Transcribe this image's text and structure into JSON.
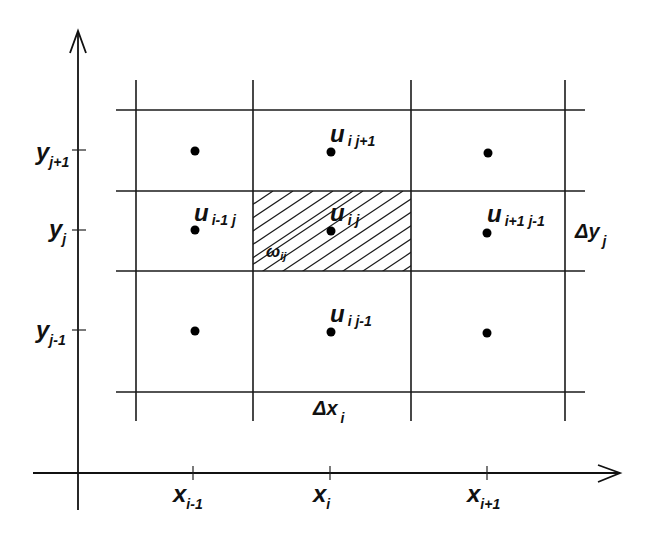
{
  "figure": {
    "colors": {
      "line": "#1a1a1a",
      "background": "#ffffff",
      "dot": "#000000"
    }
  },
  "axes": {
    "x_ticks": [
      {
        "base": "x",
        "sub": "i-1"
      },
      {
        "base": "x",
        "sub": "i"
      },
      {
        "base": "x",
        "sub": "i+1"
      }
    ],
    "y_ticks": [
      {
        "base": "y",
        "sub": "j+1"
      },
      {
        "base": "y",
        "sub": "j"
      },
      {
        "base": "y",
        "sub": "j-1"
      }
    ]
  },
  "nodes": {
    "u_i_jp1": {
      "base": "u",
      "sub": "i j+1"
    },
    "u_im1_j": {
      "base": "u",
      "sub": "i-1 j"
    },
    "u_i_j": {
      "base": "u",
      "sub": "i j"
    },
    "u_ip1_j": {
      "base": "u",
      "sub": "i+1 j-1"
    },
    "u_i_jm1": {
      "base": "u",
      "sub": "i j-1"
    }
  },
  "cell": {
    "label": {
      "base": "ω",
      "sub": "ij"
    },
    "hatched": true
  },
  "spacings": {
    "dx": {
      "base": "Δx",
      "sub": "i"
    },
    "dy": {
      "base": "Δy",
      "sub": "j"
    }
  }
}
